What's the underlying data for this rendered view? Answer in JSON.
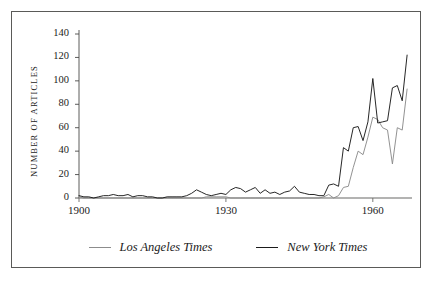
{
  "figure": {
    "background_color": "#ffffff",
    "border_color": "#5a5a58"
  },
  "chart_data": {
    "type": "line",
    "title": "",
    "subtitle": "",
    "xlabel": "",
    "ylabel": "NUMBER OF ARTICLES",
    "xlim": [
      1900,
      1968
    ],
    "ylim": [
      0,
      140
    ],
    "grid": false,
    "legend_position": "bottom",
    "xticks": [
      1900,
      1930,
      1960
    ],
    "xtick_labels": [
      "1900",
      "1930",
      "1960"
    ],
    "yticks": [
      0,
      20,
      40,
      60,
      80,
      100,
      120,
      140
    ],
    "ytick_labels": [
      "0",
      "20",
      "40",
      "60",
      "80",
      "100",
      "120",
      "140"
    ],
    "x": [
      1900,
      1901,
      1902,
      1903,
      1904,
      1905,
      1906,
      1907,
      1908,
      1909,
      1910,
      1911,
      1912,
      1913,
      1914,
      1915,
      1916,
      1917,
      1918,
      1919,
      1920,
      1921,
      1922,
      1923,
      1924,
      1925,
      1926,
      1927,
      1928,
      1929,
      1930,
      1931,
      1932,
      1933,
      1934,
      1935,
      1936,
      1937,
      1938,
      1939,
      1940,
      1941,
      1942,
      1943,
      1944,
      1945,
      1946,
      1947,
      1948,
      1949,
      1950,
      1951,
      1952,
      1953,
      1954,
      1955,
      1956,
      1957,
      1958,
      1959,
      1960,
      1961,
      1962,
      1963,
      1964,
      1965,
      1966,
      1967
    ],
    "series": [
      {
        "name": "Los Angeles Times",
        "color": "#8c8c8c",
        "values": [
          1,
          0,
          0,
          0,
          0,
          0,
          0,
          0,
          0,
          0,
          0,
          0,
          0,
          0,
          0,
          0,
          0,
          0,
          0,
          0,
          0,
          0,
          0,
          0,
          0,
          0,
          1,
          1,
          1,
          1,
          1,
          0,
          0,
          0,
          0,
          0,
          0,
          0,
          0,
          0,
          0,
          0,
          0,
          0,
          0,
          0,
          0,
          0,
          0,
          0,
          1,
          3,
          0,
          2,
          9,
          10,
          26,
          40,
          37,
          52,
          69,
          67,
          60,
          58,
          29,
          60,
          58,
          93
        ]
      },
      {
        "name": "New York Times",
        "color": "#1b1b1b",
        "values": [
          2,
          1,
          1,
          0,
          1,
          2,
          2,
          3,
          2,
          2,
          3,
          1,
          2,
          2,
          1,
          1,
          0,
          0,
          1,
          1,
          1,
          1,
          2,
          4,
          7,
          5,
          3,
          2,
          3,
          4,
          3,
          7,
          9,
          8,
          5,
          7,
          9,
          4,
          7,
          4,
          5,
          3,
          5,
          6,
          10,
          5,
          4,
          3,
          3,
          2,
          2,
          11,
          12,
          10,
          43,
          40,
          60,
          61,
          49,
          65,
          102,
          64,
          65,
          66,
          94,
          96,
          83,
          122
        ]
      }
    ]
  },
  "legend": {
    "entries": [
      {
        "label": "Los Angeles Times",
        "color": "#8c8c8c"
      },
      {
        "label": "New York Times",
        "color": "#1b1b1b"
      }
    ]
  }
}
